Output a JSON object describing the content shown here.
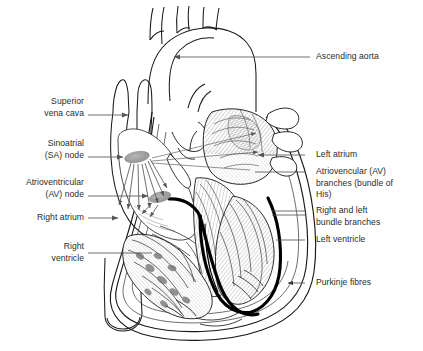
{
  "figure": {
    "kind": "anatomical-illustration",
    "background_color": "#ffffff",
    "ink_color": "#1a1a1a",
    "leader_line_color": "#555555",
    "node_fill_color": "#9a9a9a",
    "conduction_path_color": "#000000"
  },
  "labels": {
    "left": [
      {
        "id": "superior-vena-cava",
        "text": "Superior\nvena cava"
      },
      {
        "id": "sinoatrial-node",
        "text": "Sinoatrial\n(SA) node"
      },
      {
        "id": "atrioventricular-node",
        "text": "Atrioventricular\n(AV) node"
      },
      {
        "id": "right-atrium",
        "text": "Right atrium"
      },
      {
        "id": "right-ventricle",
        "text": "Right\nventricle"
      }
    ],
    "right": [
      {
        "id": "ascending-aorta",
        "text": "Ascending aorta"
      },
      {
        "id": "left-atrium",
        "text": "Left atrium"
      },
      {
        "id": "av-branches",
        "text": "Atriovencular (AV)\nbranches (bundle of\nHis)"
      },
      {
        "id": "bundle-branches",
        "text": "Right and left\nbundle branches"
      },
      {
        "id": "left-ventricle",
        "text": "Left ventricle"
      },
      {
        "id": "purkinje-fibres",
        "text": "Purkinje fibres"
      }
    ]
  }
}
